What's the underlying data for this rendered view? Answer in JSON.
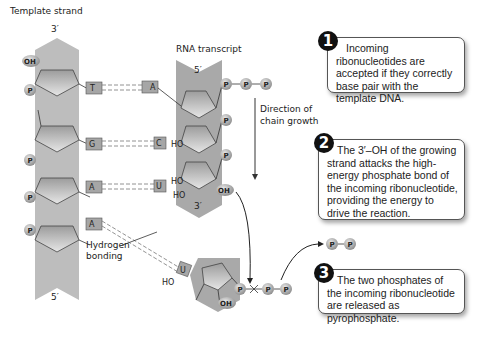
{
  "labels": {
    "template_strand": "Template strand",
    "template_3prime": "3′",
    "template_5prime": "5′",
    "rna_transcript": "RNA transcript",
    "rna_5prime": "5′",
    "rna_3prime": "3′",
    "direction_line1": "Direction of",
    "direction_line2": "chain growth",
    "hydrogen_line1": "Hydrogen",
    "hydrogen_line2": "bonding",
    "oh": "OH",
    "ho": "HO",
    "p": "P"
  },
  "template_bases": [
    "T",
    "G",
    "A",
    "A"
  ],
  "rna_bases": [
    "A",
    "C",
    "U"
  ],
  "incoming_base": "U",
  "steps": [
    {
      "number": "1",
      "text": "Incoming ribonucleotides are accepted if they correctly base pair with the template DNA."
    },
    {
      "number": "2",
      "text": "The 3′–OH of the growing strand attacks the high-energy phosphate bond of the incoming ribonucleotide, providing the energy to drive the reaction."
    },
    {
      "number": "3",
      "text": "The two phosphates of the incoming ribonucleotide are released as pyrophosphate."
    }
  ],
  "colors": {
    "backbone": "#a9a9a9",
    "sugar": "#c8c8c8",
    "phosphate": "#b5b5b5",
    "line": "#333333"
  }
}
